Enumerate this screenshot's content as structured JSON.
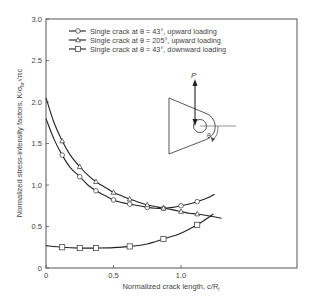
{
  "chart_data": {
    "type": "line",
    "title": "",
    "xlabel": "Normalized crack length, c/R",
    "xlabel_subscript": "i",
    "ylabel": "Normalized stress-intensity factors, K/σ",
    "ylabel_subscript": "br",
    "ylabel_suffix": "√πc",
    "xlim": [
      0,
      1.86
    ],
    "ylim": [
      0,
      3.0
    ],
    "xticks": [
      0,
      0.5,
      1.0
    ],
    "xtick_labels": [
      "0",
      "0.5",
      "1.0"
    ],
    "yticks": [
      0,
      0.5,
      1.0,
      1.5,
      2.0,
      2.5,
      3.0
    ],
    "ytick_labels": [
      "0",
      "0.5",
      "1.0",
      "1.5",
      "2.0",
      "2.5",
      "3.0"
    ],
    "grid": false,
    "legend_position": "upper-left",
    "series": [
      {
        "name": "Single crack at θ = 43°, upward loading",
        "marker": "circle",
        "curve_x": [
          0,
          0.06,
          0.12,
          0.18,
          0.25,
          0.31,
          0.37,
          0.44,
          0.5,
          0.56,
          0.62,
          0.69,
          0.75,
          0.81,
          0.87,
          0.94,
          1.0,
          1.06,
          1.12,
          1.19,
          1.25
        ],
        "curve_y": [
          1.8,
          1.55,
          1.36,
          1.21,
          1.1,
          1.0,
          0.93,
          0.87,
          0.82,
          0.79,
          0.77,
          0.75,
          0.73,
          0.72,
          0.72,
          0.73,
          0.75,
          0.77,
          0.8,
          0.84,
          0.89
        ],
        "markers_x": [
          0.12,
          0.25,
          0.37,
          0.5,
          0.62,
          0.75,
          0.87,
          1.0,
          1.12
        ],
        "markers_y": [
          1.36,
          1.1,
          0.93,
          0.82,
          0.77,
          0.73,
          0.72,
          0.75,
          0.8
        ]
      },
      {
        "name": "Single crack at θ = 205°, upward loading",
        "marker": "triangle",
        "curve_x": [
          0,
          0.06,
          0.12,
          0.18,
          0.25,
          0.31,
          0.37,
          0.44,
          0.5,
          0.56,
          0.62,
          0.69,
          0.75,
          0.81,
          0.87,
          0.94,
          1.0,
          1.06,
          1.12,
          1.2,
          1.3
        ],
        "curve_y": [
          2.05,
          1.75,
          1.53,
          1.36,
          1.22,
          1.12,
          1.04,
          0.97,
          0.91,
          0.87,
          0.83,
          0.79,
          0.76,
          0.74,
          0.72,
          0.7,
          0.68,
          0.66,
          0.65,
          0.63,
          0.6
        ],
        "markers_x": [
          0.12,
          0.25,
          0.37,
          0.5,
          0.62,
          0.75,
          0.87,
          1.0,
          1.12
        ],
        "markers_y": [
          1.53,
          1.22,
          1.04,
          0.91,
          0.83,
          0.76,
          0.72,
          0.68,
          0.65
        ]
      },
      {
        "name": "Single crack at θ = 43°, downward loading",
        "marker": "square",
        "curve_x": [
          0,
          0.12,
          0.25,
          0.37,
          0.5,
          0.62,
          0.75,
          0.87,
          1.0,
          1.12,
          1.24
        ],
        "curve_y": [
          0.27,
          0.25,
          0.24,
          0.24,
          0.245,
          0.26,
          0.29,
          0.35,
          0.42,
          0.52,
          0.65
        ],
        "markers_x": [
          0.12,
          0.25,
          0.37,
          0.62,
          0.87,
          1.12
        ],
        "markers_y": [
          0.25,
          0.24,
          0.24,
          0.26,
          0.35,
          0.52
        ]
      }
    ],
    "inset": {
      "load_label": "P",
      "angle_label": "θ",
      "description": "lug with hole, upward load P, angle θ measured clockwise from horizontal"
    }
  }
}
